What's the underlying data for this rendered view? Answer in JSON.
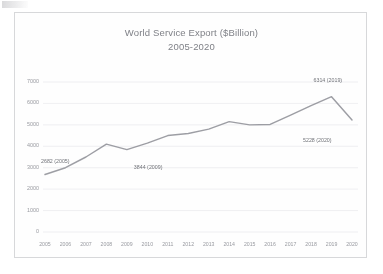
{
  "chart_data": {
    "type": "line",
    "title": "World Service Export ($Billion)",
    "subtitle": "2005-2020",
    "xlabel": "",
    "ylabel": "",
    "ylim": [
      0,
      7000
    ],
    "ytick_values": [
      7000,
      6000,
      5000,
      4000,
      3000,
      2000,
      1000,
      0
    ],
    "ytick_labels": [
      "7000",
      "6000",
      "5000",
      "4000",
      "3000",
      "2000",
      "1000",
      "0"
    ],
    "grid": true,
    "legend": "none",
    "categories": [
      "2005",
      "2006",
      "2007",
      "2008",
      "2009",
      "2010",
      "2011",
      "2012",
      "2013",
      "2014",
      "2015",
      "2016",
      "2017",
      "2018",
      "2019",
      "2020"
    ],
    "values": [
      2682,
      3000,
      3500,
      4100,
      3844,
      4150,
      4500,
      4600,
      4800,
      5150,
      5000,
      5020,
      5450,
      5900,
      6314,
      5228
    ],
    "series": [
      {
        "name": "World Service Export",
        "values": [
          2682,
          3000,
          3500,
          4100,
          3844,
          4150,
          4500,
          4600,
          4800,
          5150,
          5000,
          5020,
          5450,
          5900,
          6314,
          5228
        ]
      }
    ],
    "annotations": [
      {
        "text": "2682 (2005)",
        "year": "2005",
        "value": 2682
      },
      {
        "text": "3844 (2009)",
        "year": "2009",
        "value": 3844
      },
      {
        "text": "6314 (2019)",
        "year": "2019",
        "value": 6314
      },
      {
        "text": "5228 (2020)",
        "year": "2020",
        "value": 5228
      }
    ],
    "colors": {
      "line": "#7c7e86",
      "grid": "#e9e9ec",
      "text": "#8b8d94",
      "title": "#6d6f76",
      "background": "#ffffff",
      "frame": "#9a9ca3"
    }
  }
}
